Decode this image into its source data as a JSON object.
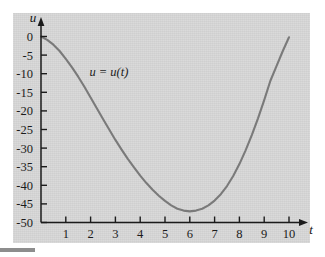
{
  "figure": {
    "background_color": "#ffffff",
    "panel_color": "#d6d6d6",
    "curve_color": "#7a7a7a",
    "axis_color": "#1b1b1b"
  },
  "chart_data": {
    "type": "line",
    "title": "",
    "subtitle": "",
    "xlabel": "t",
    "ylabel": "u",
    "xlim": [
      0,
      10.4
    ],
    "ylim": [
      -50,
      1
    ],
    "grid": false,
    "legend_position": "none",
    "annotations": [
      {
        "text": "u = u(t)",
        "x": 1.95,
        "y": -10.5,
        "style": "italic"
      }
    ],
    "xticks": [
      1,
      2,
      3,
      4,
      5,
      6,
      7,
      8,
      9,
      10
    ],
    "xticklabels": [
      "1",
      "2",
      "3",
      "4",
      "5",
      "6",
      "7",
      "8",
      "9",
      "10"
    ],
    "yticks": [
      0,
      -5,
      -10,
      -15,
      -20,
      -25,
      -30,
      -35,
      -40,
      -45,
      -50
    ],
    "yticklabels": [
      "0",
      "-5",
      "-10",
      "-15",
      "-20",
      "-25",
      "-30",
      "-35",
      "-40",
      "-45",
      "-50"
    ],
    "series": [
      {
        "name": "u(t)",
        "x": [
          0.0,
          0.25,
          0.5,
          0.75,
          1.0,
          1.25,
          1.5,
          1.75,
          2.0,
          2.25,
          2.5,
          2.75,
          3.0,
          3.25,
          3.5,
          3.75,
          4.0,
          4.25,
          4.5,
          4.75,
          5.0,
          5.25,
          5.5,
          5.75,
          6.0,
          6.25,
          6.5,
          6.75,
          7.0,
          7.25,
          7.5,
          7.75,
          8.0,
          8.25,
          8.5,
          8.75,
          9.0,
          9.25,
          9.5,
          9.75,
          10.0
        ],
        "y": [
          0.0,
          -0.9,
          -2.2,
          -3.9,
          -6.0,
          -8.3,
          -10.8,
          -13.5,
          -16.4,
          -19.3,
          -22.2,
          -25.0,
          -27.8,
          -30.4,
          -32.9,
          -35.2,
          -37.4,
          -39.4,
          -41.2,
          -42.8,
          -44.2,
          -45.4,
          -46.3,
          -46.8,
          -47.0,
          -46.8,
          -46.3,
          -45.4,
          -44.1,
          -42.4,
          -40.2,
          -37.5,
          -34.3,
          -30.6,
          -26.5,
          -22.0,
          -17.1,
          -11.9,
          -7.9,
          -3.9,
          -0.2
        ]
      }
    ]
  },
  "axis_labels": {
    "y_axis_name": "u",
    "x_axis_name": "t"
  }
}
